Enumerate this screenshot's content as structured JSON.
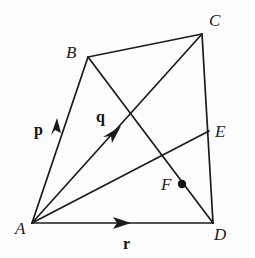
{
  "figure": {
    "background_color": "#fdfdfd",
    "ink_color": "#1b1b1b",
    "canvas": {
      "width": 255,
      "height": 258
    },
    "points": {
      "A": {
        "label": "A",
        "x": 32,
        "y": 223,
        "label_x": 15,
        "label_y": 234
      },
      "B": {
        "label": "B",
        "x": 88,
        "y": 57,
        "label_x": 66,
        "label_y": 58
      },
      "C": {
        "label": "C",
        "x": 202,
        "y": 34,
        "label_x": 209,
        "label_y": 26
      },
      "D": {
        "label": "D",
        "x": 213,
        "y": 223,
        "label_x": 214,
        "label_y": 240
      },
      "E": {
        "label": "E",
        "x": 209,
        "y": 131,
        "label_x": 215,
        "label_y": 134
      },
      "F": {
        "label": "F",
        "x": 182,
        "y": 184,
        "label_x": 161,
        "label_y": 190
      }
    },
    "vectors": [
      {
        "name": "p",
        "label": "p",
        "from": "A",
        "to": "B",
        "label_x": 34,
        "label_y": 135,
        "arrow_t": 0.42
      },
      {
        "name": "q",
        "label": "q",
        "from": "A",
        "to": "C",
        "label_x": 96,
        "label_y": 122,
        "arrow_t": 0.52
      },
      {
        "name": "r",
        "label": "r",
        "from": "A",
        "to": "D",
        "label_x": 123,
        "label_y": 249,
        "arrow_t": 0.52
      }
    ],
    "edges": [
      {
        "name": "edge-AB",
        "from": "A",
        "to": "B"
      },
      {
        "name": "edge-BC",
        "from": "B",
        "to": "C"
      },
      {
        "name": "edge-CD",
        "from": "C",
        "to": "D"
      },
      {
        "name": "edge-AD",
        "from": "A",
        "to": "D"
      }
    ],
    "diagonals": [
      {
        "name": "diagonal-AC",
        "from": "A",
        "to": "C"
      },
      {
        "name": "diagonal-BD",
        "from": "B",
        "to": "D"
      },
      {
        "name": "segment-AE",
        "from": "A",
        "to": "E"
      }
    ],
    "marked_point": {
      "name": "F",
      "x": 182,
      "y": 184,
      "radius": 4.2
    }
  }
}
